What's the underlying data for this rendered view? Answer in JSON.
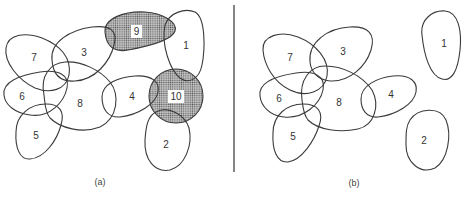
{
  "panels": [
    {
      "caption": "(a)",
      "regions": [
        {
          "id": "1",
          "label": "1",
          "shaded": false
        },
        {
          "id": "2",
          "label": "2",
          "shaded": false
        },
        {
          "id": "3",
          "label": "3",
          "shaded": false
        },
        {
          "id": "4",
          "label": "4",
          "shaded": false
        },
        {
          "id": "5",
          "label": "5",
          "shaded": false
        },
        {
          "id": "6",
          "label": "6",
          "shaded": false
        },
        {
          "id": "7",
          "label": "7",
          "shaded": false
        },
        {
          "id": "8",
          "label": "8",
          "shaded": false
        },
        {
          "id": "9",
          "label": "9",
          "shaded": true
        },
        {
          "id": "10",
          "label": "10",
          "shaded": true
        }
      ]
    },
    {
      "caption": "(b)",
      "regions": [
        {
          "id": "1",
          "label": "1",
          "shaded": false
        },
        {
          "id": "2",
          "label": "2",
          "shaded": false
        },
        {
          "id": "3",
          "label": "3",
          "shaded": false
        },
        {
          "id": "4",
          "label": "4",
          "shaded": false
        },
        {
          "id": "5",
          "label": "5",
          "shaded": false
        },
        {
          "id": "6",
          "label": "6",
          "shaded": false
        },
        {
          "id": "7",
          "label": "7",
          "shaded": false
        },
        {
          "id": "8",
          "label": "8",
          "shaded": false
        }
      ]
    }
  ],
  "colors": {
    "stroke": "#3a3a3a",
    "shade_dots": "#555555",
    "background": "#ffffff"
  }
}
